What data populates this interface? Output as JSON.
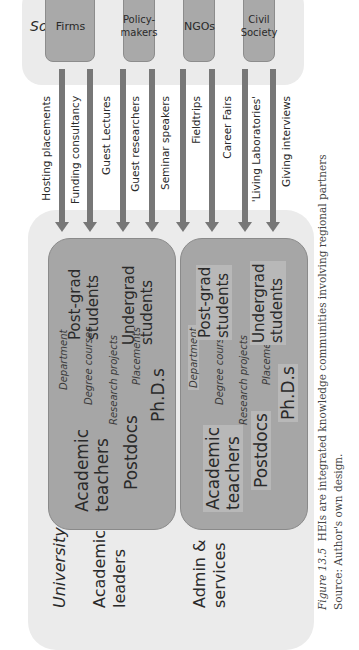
{
  "society": {
    "title": "Society",
    "actors": [
      "Firms",
      "Policy-\nmakers",
      "NGOs",
      "Civil\nSociety"
    ]
  },
  "flows": [
    "Hosting placements",
    "Funding consultancy",
    "Guest Lectures",
    "Guest researchers",
    "Seminar speakers",
    "Fieldtrips",
    "Career Fairs",
    "'Living Laboratories'",
    "Giving interviews"
  ],
  "university": {
    "title": "University",
    "rows": [
      {
        "label_line1": "Academic",
        "label_line2": "leaders",
        "department": "Department",
        "teachers_line1": "Academic",
        "teachers_line2": "teachers",
        "degree_courses": "Degree courses",
        "research_projects": "Research projects",
        "postdocs": "Postdocs",
        "placements": "Placements",
        "phds": "Ph.D.s",
        "postgrad_line1": "Post-grad",
        "postgrad_line2": "students",
        "undergrad_line1": "Undergrad",
        "undergrad_line2": "students"
      },
      {
        "label_line1": "Admin &",
        "label_line2": "services",
        "department": "Department",
        "teachers_line1": "Academic",
        "teachers_line2": "teachers",
        "degree_courses": "Degree courses",
        "research_projects": "Research projects",
        "postdocs": "Postdocs",
        "placements": "Placements",
        "phds": "Ph.D.s",
        "postgrad_line1": "Post-grad",
        "postgrad_line2": "students",
        "undergrad_line1": "Undergrad",
        "undergrad_line2": "students"
      }
    ]
  },
  "caption": {
    "figure_label": "Figure 13.5",
    "text": "HEIs are integrated knowledge communities involving regional partners",
    "source": "Source: Author's own design."
  },
  "colors": {
    "panel_bg": "#ebebeb",
    "box_fill": "#a6a6a6",
    "arrow": "#777777"
  }
}
